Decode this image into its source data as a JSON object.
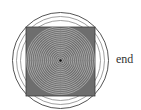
{
  "diagram": {
    "label": "end",
    "center": [
      60.5,
      60.5
    ],
    "outer_circle_radii": [
      48,
      44,
      40
    ],
    "inner_circle_count": 18,
    "inner_circle_max_radius": 34,
    "square": {
      "x": 26,
      "y": 27,
      "size": 69
    },
    "colors": {
      "background": "#ffffff",
      "square_fill": "#6e6e6e",
      "outer_stroke": "#555555",
      "inner_stroke": "#bdbdbd",
      "center_dot": "#111111",
      "label": "#333333"
    }
  }
}
